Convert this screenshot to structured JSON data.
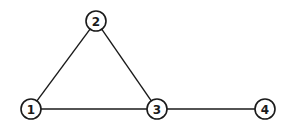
{
  "diagram": {
    "type": "undirected-graph",
    "stroke_color": "#1a1a1a",
    "background": "#ffffff",
    "node_radius": 10,
    "nodes": [
      {
        "id": "1",
        "label": "1",
        "x": 31,
        "y": 109
      },
      {
        "id": "2",
        "label": "2",
        "x": 96,
        "y": 21
      },
      {
        "id": "3",
        "label": "3",
        "x": 157,
        "y": 109
      },
      {
        "id": "4",
        "label": "4",
        "x": 265,
        "y": 109
      }
    ],
    "edges": [
      {
        "from": "1",
        "to": "2"
      },
      {
        "from": "2",
        "to": "3"
      },
      {
        "from": "1",
        "to": "3"
      },
      {
        "from": "3",
        "to": "4"
      }
    ]
  }
}
